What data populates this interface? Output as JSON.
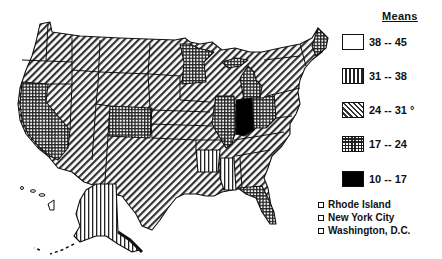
{
  "legend": {
    "title": "Means",
    "items": [
      {
        "label": "38 -- 45",
        "pattern": "blank",
        "color": "#ffffff"
      },
      {
        "label": "31 -- 38",
        "pattern": "vertical-stripes",
        "color": "#333333"
      },
      {
        "label": "24 -- 31 °",
        "pattern": "diagonal-stripes",
        "color": "#333333"
      },
      {
        "label": "17 -- 24",
        "pattern": "cross-hatch-grid",
        "color": "#222222"
      },
      {
        "label": "10 -- 17",
        "pattern": "solid-black",
        "color": "#000000"
      }
    ]
  },
  "notes": [
    {
      "label": "Rhode Island"
    },
    {
      "label": "New York City"
    },
    {
      "label": "Washington, D.C."
    }
  ],
  "map": {
    "region": "United States",
    "states": {
      "blank": [],
      "vertical-stripes": [
        "Alaska",
        "Arkansas",
        "Mississippi"
      ],
      "diagonal-stripes": [
        "Washington",
        "Oregon",
        "Idaho",
        "Montana",
        "Wyoming",
        "Nevada",
        "Utah",
        "Arizona",
        "New Mexico",
        "North Dakota",
        "South Dakota",
        "Nebraska",
        "Kansas",
        "Oklahoma",
        "Texas",
        "Iowa",
        "Missouri",
        "Wisconsin",
        "Louisiana",
        "Kentucky",
        "Tennessee",
        "Alabama",
        "Georgia",
        "South Carolina",
        "North Carolina",
        "Virginia",
        "West Virginia",
        "Pennsylvania",
        "New York",
        "Vermont",
        "New Hampshire",
        "Hawaii"
      ],
      "cross-hatch-grid": [
        "California",
        "Colorado",
        "Minnesota",
        "Illinois",
        "Michigan",
        "Ohio",
        "Florida",
        "Maine"
      ],
      "solid-black": [
        "Indiana"
      ]
    }
  }
}
